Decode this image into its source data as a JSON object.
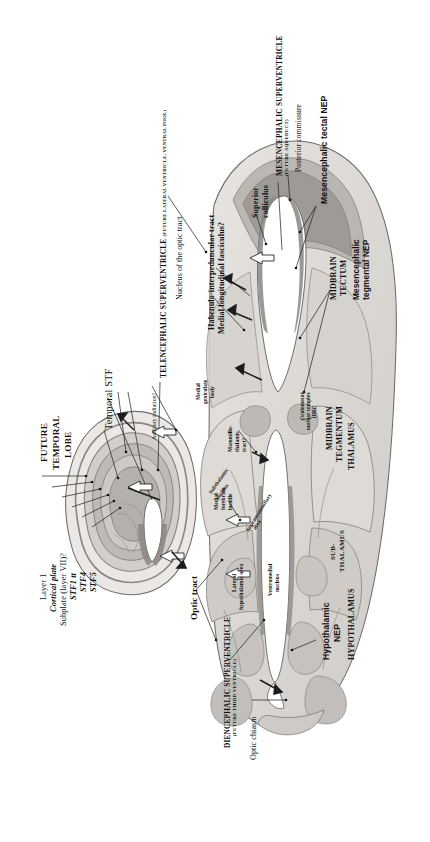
{
  "figure": {
    "type": "anatomical-section",
    "orientation": "rotated-90-ccw",
    "background": "#ffffff",
    "ink": "#111111"
  },
  "palette": {
    "tissue_light": "#e4e1dd",
    "tissue_mid": "#cbc7c3",
    "tissue_dark": "#a9a5a1",
    "tissue_darker": "#8d8a86",
    "ventricle": "#ffffff",
    "outline": "#6e6b68",
    "arrow": "#2a2a2a"
  },
  "labels": {
    "telencephalic_superventricle": "TELENCEPHALIC SUPERVENTRICLE",
    "telencephalic_superventricle_sub": "(FUTURE LATERAL VENTRICLE, VENTRAL POOL)",
    "mesencephalic_superventricle": "MESENCEPHALIC SUPERVENTRICLE",
    "mesencephalic_superventricle_sub": "(FUTURE AQUEDUCT)",
    "diencephalic_superventricle": "DIENCEPHALIC SUPERVENTRICLE",
    "diencephalic_superventricle_sub": "(FUTURE THIRD VENTRICLE)",
    "future_temporal_lobe_1": "FUTURE",
    "future_temporal_lobe_2": "TEMPORAL",
    "future_temporal_lobe_3": "LOBE",
    "layer_1": "Layer 1",
    "cortical_plate": "Cortical plate",
    "subplate": "Subplate (layer VII)?",
    "stf1": "STF1 tt",
    "stf4": "STF4",
    "stf5": "STF5",
    "temporal_stf": "Temporal STF",
    "nucleus_optic_tract": "Nucleus of the optic tract",
    "auditory_radiation": "Auditory radiation?",
    "medial_geniculate_1": "Medial",
    "medial_geniculate_2": "geniculate",
    "medial_geniculate_3": "body",
    "habenulo_interpeduncular": "Habenulo-interpeduncular tract",
    "medial_longitudinal": "Medial longitudinal fasciculus?",
    "superior_colliculus_1": "Superior",
    "superior_colliculus_2": "colliculus",
    "posterior_commissure": "Posterior commissure",
    "mesencephalic_tectal_nep": "Mesencephalic tectal NEP",
    "midbrain_tectum_1": "MIDBRAIN",
    "midbrain_tectum_2": "TECTUM",
    "mesencephalic_tegmental_nep_1": "Mesencephalic",
    "mesencephalic_tegmental_nep_2": "tegmental NEP",
    "midbrain_tegmentum_1": "MIDBRAIN",
    "midbrain_tegmentum_2": "TEGMENTUM",
    "oculomotor_1": "Oculomotor",
    "oculomotor_2": "nuclear complex",
    "oculomotor_3": "(III)?",
    "thalamus": "THALAMUS",
    "subthalamus_1": "SUB-",
    "subthalamus_2": "THALAMUS",
    "hypothalamus": "HYPOTHALAMUS",
    "hypothalamic_nep_1": "Hypothalamic",
    "hypothalamic_nep_2": "NEP",
    "mammillo_thalamic_1": "Mammillo-",
    "mammillo_thalamic_2": "thalamic",
    "mammillo_thalamic_3": "tract?",
    "medial_forebrain_1": "Medial",
    "medial_forebrain_2": "forebrain",
    "medial_forebrain_3": "bundle",
    "subthalamic_nucleus_1": "Subthalamic",
    "subthalamic_nucleus_2": "nucleus",
    "supramammillary_1": "Supramammillary",
    "supramammillary_2": "area",
    "lateral_hypothalamic_1": "Lateral",
    "lateral_hypothalamic_2": "hypothalamic area",
    "ventromedial_1": "Ventromedial",
    "ventromedial_2": "nucleus",
    "optic_tract": "Optic tract",
    "optic_chiasm": "Optic chiasm"
  }
}
